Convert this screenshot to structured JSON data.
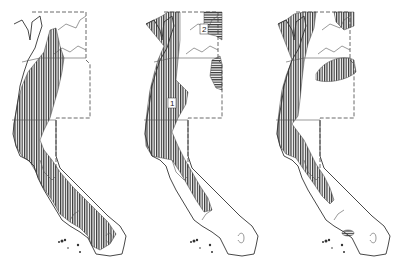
{
  "figure": {
    "panels": [
      {
        "id": "map-1",
        "labels": []
      },
      {
        "id": "map-2",
        "labels": [
          {
            "text": "1"
          },
          {
            "text": "2"
          }
        ]
      },
      {
        "id": "map-3",
        "labels": []
      }
    ]
  },
  "colors": {
    "hatch": "#333333",
    "outline": "#333333",
    "background": "#ffffff"
  }
}
